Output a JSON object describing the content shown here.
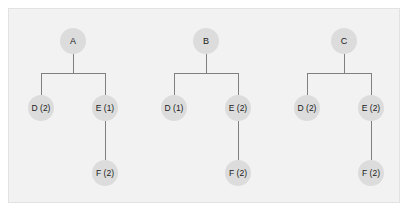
{
  "panel": {
    "background_color": "#f2f2f2",
    "border_color": "#e2e2e2",
    "outer_background_color": "#ffffff"
  },
  "style": {
    "node_fill": "#dcdcdc",
    "node_text_color": "#1a1a1a",
    "edge_color": "#808080"
  },
  "diagram": {
    "type": "tree-forest",
    "tree_count": 3,
    "trees": [
      {
        "id": "tree-1",
        "root": {
          "label": "A",
          "cx": 73,
          "cy": 41
        },
        "children": [
          {
            "label": "D (2)",
            "cx": 41,
            "cy": 108
          },
          {
            "label": "E (1)",
            "cx": 105,
            "cy": 108
          }
        ],
        "grandchildren": [
          {
            "label": "F (2)",
            "cx": 105,
            "cy": 173,
            "parent": "E (1)"
          }
        ],
        "bar_y": 73
      },
      {
        "id": "tree-2",
        "root": {
          "label": "B",
          "cx": 206,
          "cy": 41
        },
        "children": [
          {
            "label": "D (1)",
            "cx": 174,
            "cy": 108
          },
          {
            "label": "E (2)",
            "cx": 238,
            "cy": 108
          }
        ],
        "grandchildren": [
          {
            "label": "F (2)",
            "cx": 238,
            "cy": 173,
            "parent": "E (2)"
          }
        ],
        "bar_y": 73
      },
      {
        "id": "tree-3",
        "root": {
          "label": "C",
          "cx": 344,
          "cy": 41
        },
        "children": [
          {
            "label": "D (2)",
            "cx": 307,
            "cy": 108
          },
          {
            "label": "E (2)",
            "cx": 371,
            "cy": 108
          }
        ],
        "grandchildren": [
          {
            "label": "F (2)",
            "cx": 371,
            "cy": 173,
            "parent": "E (2)"
          }
        ],
        "bar_y": 73
      }
    ]
  }
}
